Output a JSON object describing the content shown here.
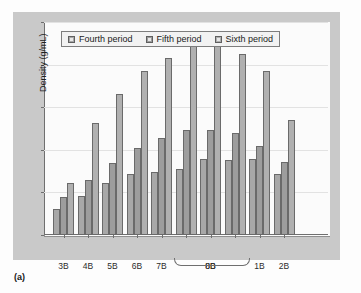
{
  "figure": {
    "caption": "(a)"
  },
  "chart_data": {
    "type": "bar",
    "title": "",
    "xlabel": "Group",
    "ylabel": "Density (g/mL)",
    "ylim": [
      0,
      25
    ],
    "yticks": [
      0,
      5,
      10,
      15,
      20,
      25
    ],
    "grid": true,
    "legend_position": "top-center",
    "categories": [
      "3B",
      "4B",
      "5B",
      "6B",
      "7B",
      "8B",
      "8B",
      "8B",
      "1B",
      "2B"
    ],
    "tick_labels": [
      "3B",
      "4B",
      "5B",
      "6B",
      "7B",
      "",
      "8B",
      "",
      "1B",
      "2B"
    ],
    "group_brace": {
      "label": "8B",
      "spans_categories": [
        5,
        6,
        7
      ]
    },
    "series": [
      {
        "name": "Fourth period",
        "color": "#a8a8a8",
        "values": [
          3.1,
          4.6,
          6.1,
          7.2,
          7.4,
          7.8,
          8.9,
          8.8,
          8.9,
          7.2
        ]
      },
      {
        "name": "Fifth period",
        "color": "#9d9d9d",
        "values": [
          4.5,
          6.4,
          8.5,
          10.2,
          11.4,
          12.3,
          12.3,
          12.0,
          10.4,
          8.6
        ]
      },
      {
        "name": "Sixth period",
        "color": "#b0b0b0",
        "values": [
          6.1,
          13.2,
          16.5,
          19.2,
          20.8,
          22.4,
          22.4,
          21.3,
          19.2,
          13.5
        ]
      }
    ]
  }
}
